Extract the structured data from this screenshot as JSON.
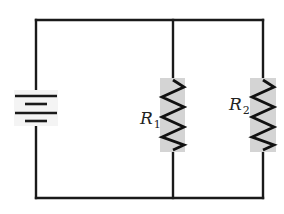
{
  "diagram": {
    "type": "circuit-schematic",
    "components": {
      "battery": {
        "symbol": "battery-icon",
        "cells": 2
      },
      "resistors": [
        {
          "id": "R1",
          "label_main": "R",
          "label_sub": "1",
          "branch": "middle"
        },
        {
          "id": "R2",
          "label_main": "R",
          "label_sub": "2",
          "branch": "right"
        }
      ]
    },
    "colors": {
      "wire": "#1a1a1a",
      "resistor_highlight": "#d4d4d4",
      "background": "#ffffff"
    }
  }
}
